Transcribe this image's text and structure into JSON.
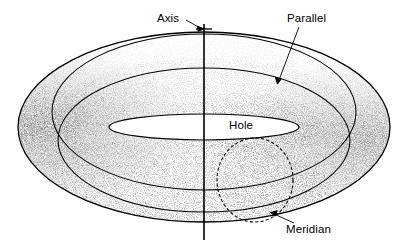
{
  "figure": {
    "name": "torus-anatomy-diagram",
    "type": "line-diagram",
    "background_color": "#ffffff",
    "stroke_color": "#000000",
    "text_color": "#000000",
    "width": 409,
    "height": 250
  },
  "labels": {
    "axis": "Axis",
    "parallel": "Parallel",
    "hole": "Hole",
    "meridian": "Meridian"
  },
  "geometry": {
    "outer_ellipse": {
      "cx": 204,
      "cy": 127,
      "rx": 186,
      "ry": 95
    },
    "top_parallel_ellipse": {
      "cx": 204,
      "cy": 112,
      "rx": 152,
      "ry": 78
    },
    "inner_ridge_ellipse": {
      "cx": 204,
      "cy": 140,
      "rx": 146,
      "ry": 72
    },
    "hole_ellipse": {
      "cx": 204,
      "cy": 127,
      "rx": 95,
      "ry": 13
    },
    "meridian_circle": {
      "cx": 255,
      "cy": 180,
      "rx": 38,
      "ry": 42,
      "dashed": true
    },
    "axis_line": {
      "x": 204,
      "y_top": 24,
      "y_bottom": 240
    }
  },
  "leaders": {
    "axis": {
      "from_x": 188,
      "from_y": 22,
      "to_x": 204,
      "to_y": 29,
      "arrow": true
    },
    "parallel": {
      "from_x": 298,
      "from_y": 26,
      "to_x": 278,
      "to_y": 82,
      "arrow": true
    },
    "meridian": {
      "from_x": 293,
      "from_y": 222,
      "to_x": 272,
      "to_y": 213,
      "arrow": true
    }
  }
}
